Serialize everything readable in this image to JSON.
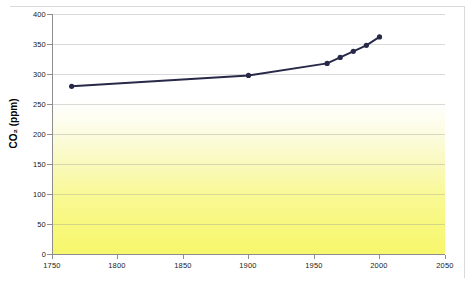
{
  "chart_data": {
    "type": "line",
    "title": "",
    "xlabel": "",
    "ylabel": "CO₂ (ppm)",
    "xlim": [
      1750,
      2050
    ],
    "ylim": [
      0,
      400
    ],
    "grid": true,
    "legend": false,
    "x_ticks": [
      "1750",
      "1800",
      "1850",
      "1900",
      "1950",
      "2000",
      "2050"
    ],
    "y_ticks": [
      "0",
      "50",
      "100",
      "150",
      "200",
      "250",
      "300",
      "350",
      "400"
    ],
    "series": [
      {
        "name": "Atmospheric CO2",
        "marker": "circle",
        "color": "#282848",
        "x": [
          1765,
          1900,
          1960,
          1970,
          1980,
          1990,
          2000
        ],
        "values": [
          280,
          298,
          318,
          328,
          338,
          348,
          362
        ]
      }
    ]
  },
  "axis": {
    "y_title": "CO₂ (ppm)",
    "y_ticks": [
      {
        "label": "400",
        "value": 400
      },
      {
        "label": "350",
        "value": 350
      },
      {
        "label": "300",
        "value": 300
      },
      {
        "label": "250",
        "value": 250
      },
      {
        "label": "200",
        "value": 200
      },
      {
        "label": "150",
        "value": 150
      },
      {
        "label": "100",
        "value": 100
      },
      {
        "label": "50",
        "value": 50
      },
      {
        "label": "0",
        "value": 0
      }
    ],
    "x_ticks": [
      {
        "label": "1750",
        "value": 1750
      },
      {
        "label": "1800",
        "value": 1800
      },
      {
        "label": "1850",
        "value": 1850
      },
      {
        "label": "1900",
        "value": 1900
      },
      {
        "label": "1950",
        "value": 1950
      },
      {
        "label": "2000",
        "value": 2000
      },
      {
        "label": "2050",
        "value": 2050
      }
    ]
  },
  "colors": {
    "line": "#282848",
    "marker": "#1e1e3c",
    "axis": "#8e8e8e",
    "grid": "#969696",
    "plot_top": "#ffffff",
    "plot_bottom": "#f7f76c"
  }
}
